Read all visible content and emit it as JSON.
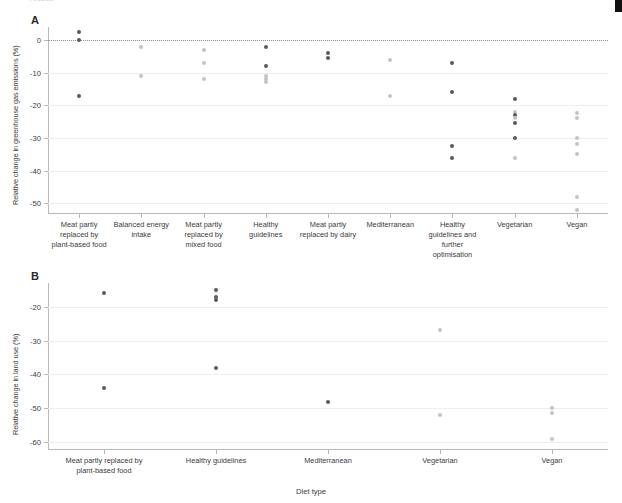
{
  "figure": {
    "top_sliver_text": "Articles",
    "xaxis_title": "Diet type",
    "colors": {
      "dark_dot": "#5a5a5a",
      "light_dot": "#c3c3c3",
      "grid": "#eeeeee",
      "axis": "#b9b9b9"
    }
  },
  "panel_a": {
    "letter": "A",
    "ylabel": "Relative change in greenhouse gas emissions (%)",
    "chart_data": {
      "type": "scatter",
      "title": "",
      "xlabel": "Diet type",
      "ylabel": "Relative change in greenhouse gas emissions (%)",
      "ylim": [
        -53,
        4
      ],
      "yticks": [
        0,
        -10,
        -20,
        -30,
        -40,
        -50
      ],
      "ytick_labels": [
        "0",
        "-10",
        "-20",
        "-30",
        "-40",
        "-50"
      ],
      "grid": true,
      "zero_reference_line": 0,
      "categories": [
        "Meat partly replaced by plant-based food",
        "Balanced energy intake",
        "Meat partly replaced by mixed food",
        "Healthy guidelines",
        "Meat partly replaced by dairy",
        "Mediterranean",
        "Healthy guidelines and further optimisation",
        "Vegetarian",
        "Vegan"
      ],
      "series": [
        {
          "name": "Meat partly replaced by plant-based food",
          "points": [
            {
              "value": 2.5,
              "shade": "dark"
            },
            {
              "value": 0.0,
              "shade": "dark"
            },
            {
              "value": -17.0,
              "shade": "dark"
            }
          ]
        },
        {
          "name": "Balanced energy intake",
          "points": [
            {
              "value": -2.0,
              "shade": "light"
            },
            {
              "value": -11.0,
              "shade": "light"
            }
          ]
        },
        {
          "name": "Meat partly replaced by mixed food",
          "points": [
            {
              "value": -3.0,
              "shade": "light"
            },
            {
              "value": -7.0,
              "shade": "light"
            },
            {
              "value": -12.0,
              "shade": "light"
            }
          ]
        },
        {
          "name": "Healthy guidelines",
          "points": [
            {
              "value": -2.0,
              "shade": "dark"
            },
            {
              "value": -8.0,
              "shade": "dark"
            },
            {
              "value": -11.0,
              "shade": "light"
            },
            {
              "value": -12.0,
              "shade": "light"
            },
            {
              "value": -12.8,
              "shade": "light"
            }
          ]
        },
        {
          "name": "Meat partly replaced by dairy",
          "points": [
            {
              "value": -4.0,
              "shade": "dark"
            },
            {
              "value": -5.5,
              "shade": "dark"
            }
          ]
        },
        {
          "name": "Mediterranean",
          "points": [
            {
              "value": -6.0,
              "shade": "light"
            },
            {
              "value": -17.0,
              "shade": "light"
            }
          ]
        },
        {
          "name": "Healthy guidelines and further optimisation",
          "points": [
            {
              "value": -7.0,
              "shade": "dark"
            },
            {
              "value": -16.0,
              "shade": "dark"
            },
            {
              "value": -32.5,
              "shade": "dark"
            },
            {
              "value": -36.0,
              "shade": "dark"
            }
          ]
        },
        {
          "name": "Vegetarian",
          "points": [
            {
              "value": -18.0,
              "shade": "dark"
            },
            {
              "value": -22.0,
              "shade": "light"
            },
            {
              "value": -23.0,
              "shade": "dark"
            },
            {
              "value": -24.0,
              "shade": "light"
            },
            {
              "value": -25.5,
              "shade": "dark"
            },
            {
              "value": -30.0,
              "shade": "dark"
            },
            {
              "value": -36.0,
              "shade": "light"
            }
          ]
        },
        {
          "name": "Vegan",
          "points": [
            {
              "value": -22.5,
              "shade": "light"
            },
            {
              "value": -24.0,
              "shade": "light"
            },
            {
              "value": -30.0,
              "shade": "light"
            },
            {
              "value": -32.0,
              "shade": "light"
            },
            {
              "value": -35.0,
              "shade": "light"
            },
            {
              "value": -48.0,
              "shade": "light"
            },
            {
              "value": -52.0,
              "shade": "light"
            }
          ]
        }
      ]
    }
  },
  "panel_b": {
    "letter": "B",
    "ylabel": "Relative change in land use (%)",
    "chart_data": {
      "type": "scatter",
      "title": "",
      "xlabel": "Diet type",
      "ylabel": "Relative change in land use (%)",
      "ylim": [
        -62,
        -13
      ],
      "yticks": [
        -20,
        -30,
        -40,
        -50,
        -60
      ],
      "ytick_labels": [
        "-20",
        "-30",
        "-40",
        "-50",
        "-60"
      ],
      "grid": true,
      "categories": [
        "Meat partly replaced by plant-based food",
        "Healthy guidelines",
        "Mediterranean",
        "Vegetarian",
        "Vegan"
      ],
      "series": [
        {
          "name": "Meat partly replaced by plant-based food",
          "points": [
            {
              "value": -16.0,
              "shade": "dark"
            },
            {
              "value": -44.0,
              "shade": "dark"
            }
          ]
        },
        {
          "name": "Healthy guidelines",
          "points": [
            {
              "value": -15.0,
              "shade": "dark"
            },
            {
              "value": -17.0,
              "shade": "dark"
            },
            {
              "value": -18.0,
              "shade": "dark"
            },
            {
              "value": -38.0,
              "shade": "dark"
            }
          ]
        },
        {
          "name": "Mediterranean",
          "points": [
            {
              "value": -48.0,
              "shade": "dark"
            }
          ]
        },
        {
          "name": "Vegetarian",
          "points": [
            {
              "value": -27.0,
              "shade": "light"
            },
            {
              "value": -52.0,
              "shade": "light"
            }
          ]
        },
        {
          "name": "Vegan",
          "points": [
            {
              "value": -50.0,
              "shade": "light"
            },
            {
              "value": -51.5,
              "shade": "light"
            },
            {
              "value": -59.0,
              "shade": "light"
            }
          ]
        }
      ]
    }
  }
}
